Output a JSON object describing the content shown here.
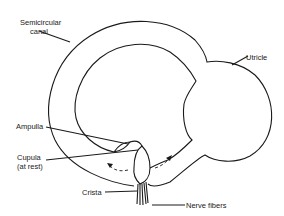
{
  "diagram": {
    "labels": {
      "semicircular_canal_line1": "Semicircular",
      "semicircular_canal_line2": "canal",
      "utricle": "Utricle",
      "ampulla": "Ampulla",
      "cupula_line1": "Cupula",
      "cupula_line2": "(at rest)",
      "crista": "Crista",
      "nerve_fibers": "Nerve fibers"
    },
    "colors": {
      "stroke": "#1a1a1a",
      "background": "#ffffff"
    }
  }
}
